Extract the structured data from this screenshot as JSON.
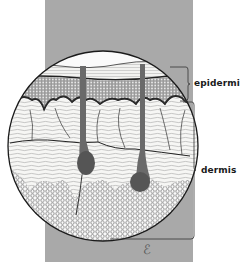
{
  "figure": {
    "labels": {
      "epidermis": "epidermis",
      "dermis": "dermis"
    },
    "signature": "ℰ",
    "colors": {
      "band": "#a9a9a9",
      "background": "#ffffff",
      "ink": "#1a1a1a",
      "paper": "#f4f4f2"
    }
  }
}
